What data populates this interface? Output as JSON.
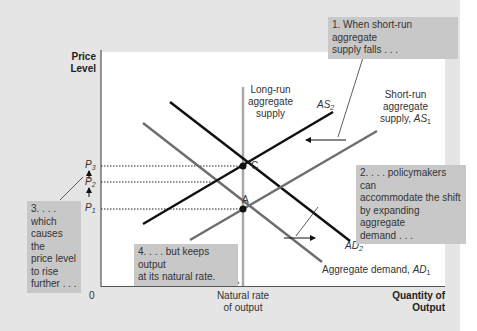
{
  "axes": {
    "y_label_line1": "Price",
    "y_label_line2": "Level",
    "x_label_line1": "Quantity of",
    "x_label_line2": "Output",
    "origin": "0",
    "natural_rate_line1": "Natural rate",
    "natural_rate_line2": "of output"
  },
  "price_levels": {
    "p3": "P",
    "p3_sub": "3",
    "p2": "P",
    "p2_sub": "2",
    "p1": "P",
    "p1_sub": "1"
  },
  "points": {
    "c": "C",
    "a": "A"
  },
  "curves": {
    "lras_line1": "Long-run",
    "lras_line2": "aggregate",
    "lras_line3": "supply",
    "as2": "AS",
    "as2_sub": "2",
    "as1_line1": "Short-run",
    "as1_line2": "aggregate",
    "as1_line3": "supply, ",
    "as1_sym": "AS",
    "as1_sub": "1",
    "ad2": "AD",
    "ad2_sub": "2",
    "ad1_text": "Aggregate demand, ",
    "ad1_sym": "AD",
    "ad1_sub": "1"
  },
  "callouts": {
    "c1_line1": "1. When short-run aggregate",
    "c1_line2": "supply falls . . .",
    "c2_line1": "2. . . . policymakers can",
    "c2_line2": "accommodate the shift",
    "c2_line3": "by expanding aggregate",
    "c2_line4": "demand . . .",
    "c3_line1": "3. . . . which",
    "c3_line2": "causes the",
    "c3_line3": "price level",
    "c3_line4": "to rise",
    "c3_line5": "further . . .",
    "c4_line1": "4. . . . but keeps output",
    "c4_line2": "at its natural rate."
  },
  "colors": {
    "background": "#e5e5e5",
    "plot": "#ffffff",
    "callout": "#c8c8c8",
    "black_curve": "#111111",
    "gray_curve": "#6e6e6e",
    "lras": "#a8a8a8"
  }
}
